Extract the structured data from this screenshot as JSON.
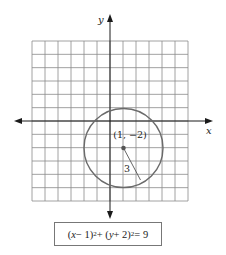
{
  "chart_data": {
    "type": "diagram",
    "title": "",
    "xlabel": "x",
    "ylabel": "y",
    "grid": {
      "on": true,
      "x_range": [
        -6,
        6
      ],
      "y_range": [
        -6,
        6
      ],
      "step": 1
    },
    "circle": {
      "center": [
        1,
        -2
      ],
      "radius": 3
    },
    "annotations": [
      {
        "text": "(1, −2)",
        "at": [
          1,
          -2
        ],
        "role": "center-label"
      },
      {
        "text": "3",
        "role": "radius-label"
      }
    ],
    "equation": "(x − 1)^2 + (y + 2)^2 = 9"
  },
  "axes": {
    "x_label": "x",
    "y_label": "y"
  },
  "labels": {
    "center": "(1, −2)",
    "radius": "3"
  },
  "equation": {
    "part1": "(",
    "x": "x",
    "part2": " − 1)",
    "exp1": "2",
    "part3": " + (",
    "y": "y",
    "part4": " + 2)",
    "exp2": "2",
    "part5": " = 9"
  },
  "colors": {
    "grid": "#8a8a8a",
    "axis": "#1a1a1a",
    "circle": "#6a6a6a",
    "center_dot": "#555555"
  }
}
